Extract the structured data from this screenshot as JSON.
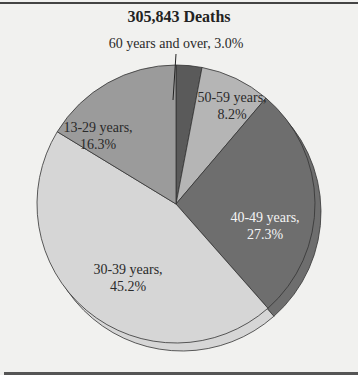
{
  "chart_data": {
    "type": "pie",
    "title": "305,843 Deaths",
    "start": "top, clockwise",
    "slices": [
      {
        "label": "60 years and over",
        "value": 3.0,
        "display": "60 years and over, 3.0%",
        "color": "#5a5a5a",
        "exploded": false
      },
      {
        "label": "50-59 years",
        "value": 8.2,
        "display_lines": [
          "50-59 years,",
          "8.2%"
        ],
        "color": "#b5b5b5",
        "exploded": false
      },
      {
        "label": "40-49 years",
        "value": 27.3,
        "display_lines": [
          "40-49 years,",
          "27.3%"
        ],
        "color": "#6e6e6e",
        "exploded": true
      },
      {
        "label": "30-39 years",
        "value": 45.2,
        "display_lines": [
          "30-39 years,",
          "45.2%"
        ],
        "color": "#d6d6d6",
        "exploded": true
      },
      {
        "label": "13-29 years",
        "value": 16.3,
        "display_lines": [
          "13-29 years,",
          "16.3%"
        ],
        "color": "#9b9b9b",
        "exploded": false
      }
    ],
    "unit": "%"
  }
}
